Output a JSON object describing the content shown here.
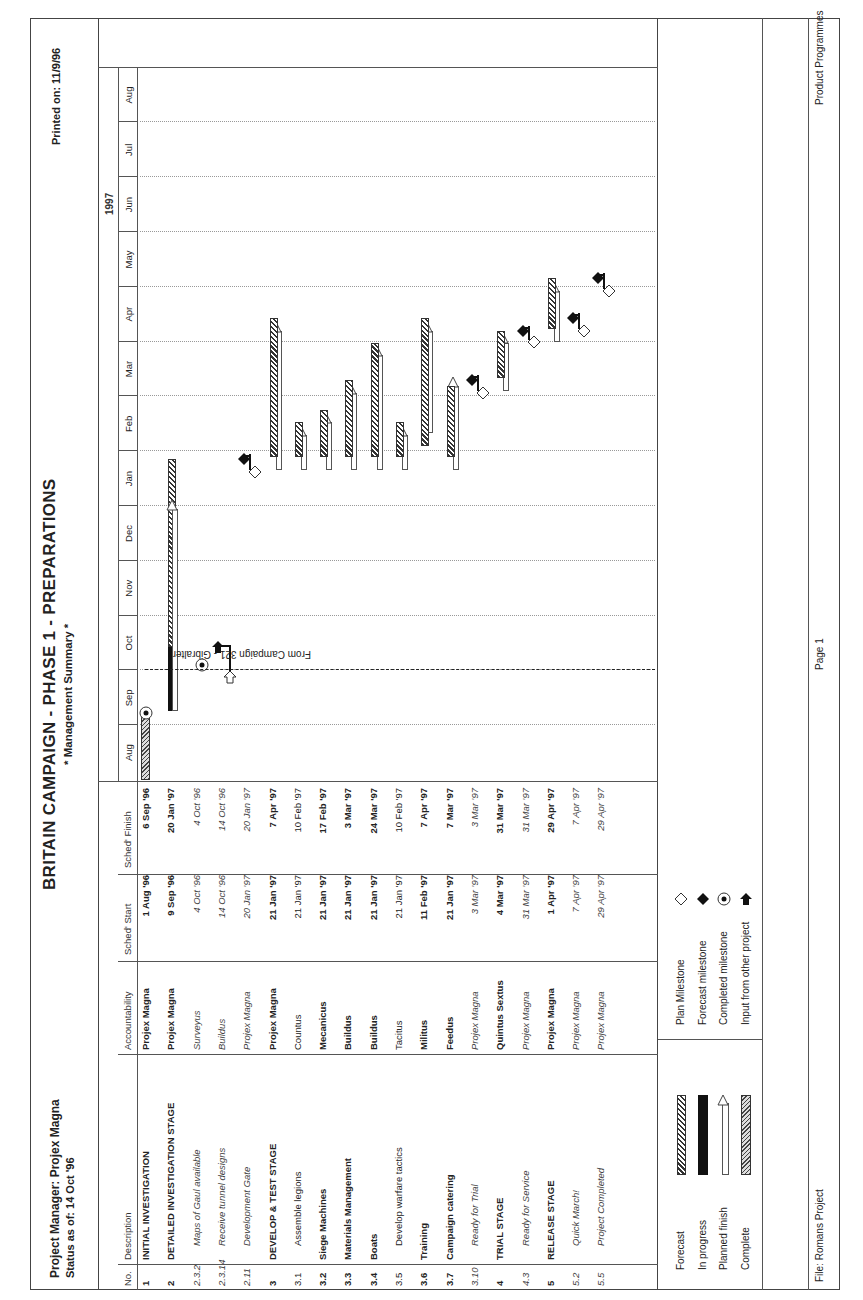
{
  "header": {
    "title": "BRITAIN CAMPAIGN - PHASE 1 - PREPARATIONS",
    "subtitle": "* Management Summary *",
    "project_manager": "Project Manager: Projex Magna",
    "status_as_of": "Status as of: 14 Oct '96",
    "printed_on": "Printed on: 11/9/96"
  },
  "table": {
    "columns": [
      "No.",
      "Description",
      "Accountability",
      "Sched' Start",
      "Sched' Finish"
    ],
    "rows": [
      {
        "no": "1",
        "description": "INITIAL INVESTIGATION",
        "accountability": "Projex Magna",
        "start": "1 Aug '96",
        "finish": "6 Sep '96",
        "style": "bold"
      },
      {
        "no": "2",
        "description": "DETAILED INVESTIGATION STAGE",
        "accountability": "Projex Magna",
        "start": "9 Sep '96",
        "finish": "20 Jan '97",
        "style": "bold"
      },
      {
        "no": "2.3.2",
        "description": "Maps of Gaul available",
        "accountability": "Surveyus",
        "start": "4 Oct '96",
        "finish": "4 Oct '96",
        "style": "italic"
      },
      {
        "no": "2.3.14",
        "description": "Receive tunnel designs",
        "accountability": "Buildus",
        "start": "14 Oct '96",
        "finish": "14 Oct '96",
        "style": "italic"
      },
      {
        "no": "2.11",
        "description": "Development Gate",
        "accountability": "Projex Magna",
        "start": "20 Jan '97",
        "finish": "20 Jan '97",
        "style": "italic"
      },
      {
        "no": "3",
        "description": "DEVELOP & TEST STAGE",
        "accountability": "Projex Magna",
        "start": "21 Jan '97",
        "finish": "7 Apr '97",
        "style": "bold"
      },
      {
        "no": "3.1",
        "description": "Assemble legions",
        "accountability": "Countus",
        "start": "21 Jan '97",
        "finish": "10 Feb '97",
        "style": "normal"
      },
      {
        "no": "3.2",
        "description": "Siege Machines",
        "accountability": "Mecanicus",
        "start": "21 Jan '97",
        "finish": "17 Feb '97",
        "style": "bold"
      },
      {
        "no": "3.3",
        "description": "Materials Management",
        "accountability": "Buildus",
        "start": "21 Jan '97",
        "finish": "3 Mar '97",
        "style": "bold"
      },
      {
        "no": "3.4",
        "description": "Boats",
        "accountability": "Buildus",
        "start": "21 Jan '97",
        "finish": "24 Mar '97",
        "style": "bold"
      },
      {
        "no": "3.5",
        "description": "Develop warfare tactics",
        "accountability": "Tacitus",
        "start": "21 Jan '97",
        "finish": "10 Feb '97",
        "style": "normal"
      },
      {
        "no": "3.6",
        "description": "Training",
        "accountability": "Militus",
        "start": "11 Feb '97",
        "finish": "7 Apr '97",
        "style": "bold"
      },
      {
        "no": "3.7",
        "description": "Campaign catering",
        "accountability": "Feedus",
        "start": "21 Jan '97",
        "finish": "7 Mar '97",
        "style": "bold"
      },
      {
        "no": "3.10",
        "description": "Ready for Trial",
        "accountability": "Projex Magna",
        "start": "3 Mar '97",
        "finish": "3 Mar '97",
        "style": "italic"
      },
      {
        "no": "4",
        "description": "TRIAL STAGE",
        "accountability": "Quintus Sextus",
        "start": "4 Mar '97",
        "finish": "31 Mar '97",
        "style": "bold"
      },
      {
        "no": "4.3",
        "description": "Ready for Service",
        "accountability": "Projex Magna",
        "start": "31 Mar '97",
        "finish": "31 Mar '97",
        "style": "italic"
      },
      {
        "no": "5",
        "description": "RELEASE STAGE",
        "accountability": "Projex Magna",
        "start": "1 Apr '97",
        "finish": "29 Apr '97",
        "style": "bold"
      },
      {
        "no": "5.2",
        "description": "Quick March!",
        "accountability": "Projex Magna",
        "start": "7 Apr '97",
        "finish": "7 Apr '97",
        "style": "italic"
      },
      {
        "no": "5.5",
        "description": "Project Completed",
        "accountability": "Projex Magna",
        "start": "29 Apr '97",
        "finish": "29 Apr '97",
        "style": "italic"
      }
    ]
  },
  "timeline": {
    "year_label": "1997",
    "months": [
      "Aug",
      "Sep",
      "Oct",
      "Nov",
      "Dec",
      "Jan",
      "Feb",
      "Mar",
      "Apr",
      "May",
      "Jun",
      "Jul",
      "Aug"
    ],
    "annotation": "From Campaign 321 - Gibralter"
  },
  "legend": {
    "items": [
      {
        "label": "Forecast",
        "symbol": "hatched-bar"
      },
      {
        "label": "In progress",
        "symbol": "black-bar"
      },
      {
        "label": "Planned finish",
        "symbol": "open-bar-triangle"
      },
      {
        "label": "Complete",
        "symbol": "crosshatch-bar"
      }
    ],
    "milestones": [
      {
        "label": "Plan Milestone",
        "symbol": "open-diamond"
      },
      {
        "label": "Forecast milestone",
        "symbol": "filled-diamond"
      },
      {
        "label": "Completed milestone",
        "symbol": "circle-dot"
      },
      {
        "label": "Input from other project",
        "symbol": "arrow"
      }
    ]
  },
  "footer": {
    "file": "File: Romans Project",
    "page": "Page 1",
    "group": "Product Programmes"
  },
  "chart_data": {
    "type": "gantt",
    "title": "BRITAIN CAMPAIGN - PHASE 1 - PREPARATIONS",
    "status_date": "14 Oct '96",
    "x_axis": [
      "Aug '96",
      "Sep '96",
      "Oct '96",
      "Nov '96",
      "Dec '96",
      "Jan '97",
      "Feb '97",
      "Mar '97",
      "Apr '97",
      "May '97",
      "Jun '97",
      "Jul '97",
      "Aug '97"
    ],
    "tasks": [
      {
        "no": "1",
        "name": "INITIAL INVESTIGATION",
        "start": "1 Aug '96",
        "finish": "6 Sep '96",
        "status": "complete"
      },
      {
        "no": "2",
        "name": "DETAILED INVESTIGATION STAGE",
        "start": "9 Sep '96",
        "finish": "20 Jan '97",
        "status": "in progress to 14 Oct '96, forecast to ~27 Jan '97"
      },
      {
        "no": "2.3.2",
        "name": "Maps of Gaul available",
        "date": "4 Oct '96",
        "status": "completed milestone"
      },
      {
        "no": "2.3.14",
        "name": "Receive tunnel designs",
        "date": "14 Oct '96",
        "status": "input from other project (From Campaign 321 - Gibralter)"
      },
      {
        "no": "2.11",
        "name": "Development Gate",
        "date": "20 Jan '97",
        "status": "forecast milestone slipped ~1 week"
      },
      {
        "no": "3",
        "name": "DEVELOP & TEST STAGE",
        "start": "21 Jan '97",
        "finish": "7 Apr '97",
        "status": "forecast"
      },
      {
        "no": "3.1",
        "name": "Assemble legions",
        "start": "21 Jan '97",
        "finish": "10 Feb '97",
        "status": "forecast"
      },
      {
        "no": "3.2",
        "name": "Siege Machines",
        "start": "21 Jan '97",
        "finish": "17 Feb '97",
        "status": "forecast"
      },
      {
        "no": "3.3",
        "name": "Materials Management",
        "start": "21 Jan '97",
        "finish": "3 Mar '97",
        "status": "forecast"
      },
      {
        "no": "3.4",
        "name": "Boats",
        "start": "21 Jan '97",
        "finish": "24 Mar '97",
        "status": "forecast"
      },
      {
        "no": "3.5",
        "name": "Develop warfare tactics",
        "start": "21 Jan '97",
        "finish": "10 Feb '97",
        "status": "forecast"
      },
      {
        "no": "3.6",
        "name": "Training",
        "start": "11 Feb '97",
        "finish": "7 Apr '97",
        "status": "forecast"
      },
      {
        "no": "3.7",
        "name": "Campaign catering",
        "start": "21 Jan '97",
        "finish": "7 Mar '97",
        "status": "forecast"
      },
      {
        "no": "3.10",
        "name": "Ready for Trial",
        "date": "3 Mar '97",
        "status": "milestone"
      },
      {
        "no": "4",
        "name": "TRIAL STAGE",
        "start": "4 Mar '97",
        "finish": "31 Mar '97",
        "status": "forecast"
      },
      {
        "no": "4.3",
        "name": "Ready for Service",
        "date": "31 Mar '97",
        "status": "milestone"
      },
      {
        "no": "5",
        "name": "RELEASE STAGE",
        "start": "1 Apr '97",
        "finish": "29 Apr '97",
        "status": "forecast"
      },
      {
        "no": "5.2",
        "name": "Quick March!",
        "date": "7 Apr '97",
        "status": "milestone"
      },
      {
        "no": "5.5",
        "name": "Project Completed",
        "date": "29 Apr '97",
        "status": "milestone"
      }
    ]
  }
}
